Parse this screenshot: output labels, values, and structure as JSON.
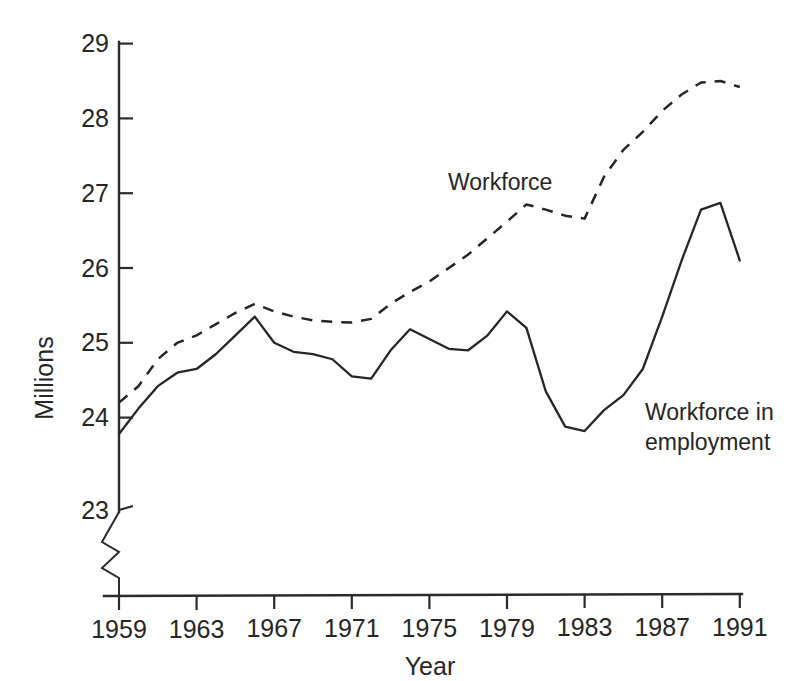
{
  "chart_data": {
    "type": "line",
    "title": "",
    "xlabel": "Year",
    "ylabel": "Millions",
    "xlim": [
      1958,
      1991
    ],
    "ylim": [
      22.6,
      29
    ],
    "y_axis_break": true,
    "y_axis_break_note": "axis broken below 23",
    "grid": false,
    "legend": "inline-annotations",
    "x_tick_labels": [
      "1959",
      "1963",
      "1967",
      "1971",
      "1975",
      "1979",
      "1983",
      "1987",
      "1991"
    ],
    "x_ticks": [
      1959,
      1963,
      1967,
      1971,
      1975,
      1979,
      1983,
      1987,
      1991
    ],
    "y_tick_labels": [
      "23",
      "24",
      "25",
      "26",
      "27",
      "28",
      "29"
    ],
    "y_ticks": [
      23,
      24,
      25,
      26,
      27,
      28,
      29
    ],
    "x": [
      1959,
      1960,
      1961,
      1962,
      1963,
      1964,
      1965,
      1966,
      1967,
      1968,
      1969,
      1970,
      1971,
      1972,
      1973,
      1974,
      1975,
      1976,
      1977,
      1978,
      1979,
      1980,
      1981,
      1982,
      1983,
      1984,
      1985,
      1986,
      1987,
      1988,
      1989,
      1990,
      1991
    ],
    "series": [
      {
        "name": "Workforce",
        "style": "dashed",
        "values": [
          24.2,
          24.42,
          24.78,
          25.0,
          25.1,
          25.25,
          25.4,
          25.52,
          25.42,
          25.35,
          25.3,
          25.28,
          25.27,
          25.32,
          25.52,
          25.68,
          25.82,
          26.0,
          26.18,
          26.4,
          26.62,
          26.85,
          26.78,
          26.7,
          26.66,
          27.22,
          27.58,
          27.82,
          28.1,
          28.32,
          28.48,
          28.5,
          28.42
        ]
      },
      {
        "name": "Workforce in employment",
        "style": "solid",
        "values": [
          23.78,
          24.12,
          24.42,
          24.6,
          24.65,
          24.85,
          25.1,
          25.35,
          25.0,
          24.88,
          24.85,
          24.78,
          24.55,
          24.52,
          24.9,
          25.18,
          25.05,
          24.92,
          24.9,
          25.1,
          25.42,
          25.2,
          24.35,
          23.88,
          23.82,
          24.1,
          24.3,
          24.65,
          25.35,
          26.1,
          26.78,
          26.87,
          26.1
        ]
      }
    ],
    "annotations": [
      {
        "text": "Workforce",
        "x_px": 448,
        "y_px": 190
      },
      {
        "text": "Workforce in\nemployment",
        "x_px": 645,
        "y_px": 420,
        "lines": [
          "Workforce in",
          "employment"
        ]
      }
    ]
  }
}
